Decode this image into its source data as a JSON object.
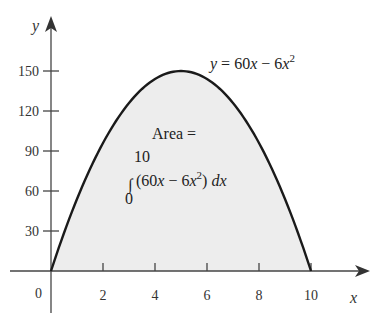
{
  "chart_data": {
    "type": "area",
    "title": "",
    "function": "y = 60x - 6x^2",
    "curve_label": "y = 60x − 6x²",
    "annotation": {
      "line1": "Area =",
      "integral_upper": "10",
      "integral_lower": "0",
      "integrand": "(60x − 6x²) dx"
    },
    "x": [
      0,
      1,
      2,
      3,
      4,
      5,
      6,
      7,
      8,
      9,
      10
    ],
    "values": [
      0,
      54,
      96,
      126,
      144,
      150,
      144,
      126,
      96,
      54,
      0
    ],
    "xlabel": "x",
    "ylabel": "y",
    "x_ticks": [
      "2",
      "4",
      "6",
      "8",
      "10"
    ],
    "y_ticks": [
      "30",
      "60",
      "90",
      "120",
      "150"
    ],
    "origin_label": "0",
    "xlim": [
      0,
      10
    ],
    "ylim": [
      0,
      150
    ],
    "grid": false,
    "legend": "none",
    "fill_color": "#ededed",
    "curve_color": "#1a1a1a"
  }
}
